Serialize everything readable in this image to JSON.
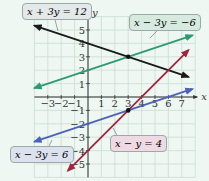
{
  "chart_data": {
    "type": "line",
    "title": "",
    "xlabel": "x",
    "ylabel": "y",
    "xlim": [
      -4,
      8
    ],
    "ylim": [
      -6,
      6
    ],
    "grid": true,
    "x_ticks": [
      "-3",
      "-2",
      "-1",
      "1",
      "2",
      "3",
      "4",
      "5",
      "6",
      "7"
    ],
    "y_ticks": [
      "5",
      "4",
      "3",
      "2",
      "1",
      "-1",
      "-2",
      "-3",
      "-4",
      "-5"
    ],
    "series": [
      {
        "name": "x + 3y = 12",
        "equation": "y = 4 - x/3",
        "color": "#1a1a1a",
        "x": [
          -4,
          7.5
        ],
        "y": [
          5.33,
          1.5
        ]
      },
      {
        "name": "x - 3y = -6",
        "equation": "y = 2 + x/3",
        "color": "#2e9a72",
        "x": [
          -4,
          7.8
        ],
        "y": [
          0.67,
          4.6
        ]
      },
      {
        "name": "x - 3y = 6",
        "equation": "y = -2 + x/3",
        "color": "#4d63b8",
        "x": [
          -4,
          7.8
        ],
        "y": [
          -3.33,
          0.6
        ]
      },
      {
        "name": "x - y = 4",
        "equation": "y = x - 4",
        "color": "#a3243f",
        "x": [
          -1.5,
          7.5
        ],
        "y": [
          -5.5,
          3.5
        ]
      }
    ],
    "points": [
      {
        "x": 3,
        "y": 3,
        "label": "intersection of x + 3y = 12 and x - 3y = -6"
      },
      {
        "x": 3,
        "y": -1,
        "label": "intersection of x - 3y = 6 and x - y = 4"
      }
    ],
    "annotations": [
      {
        "text": "x + 3y = 12",
        "bg": "#e6e9ea"
      },
      {
        "text": "x - 3y = -6",
        "bg": "#d8ebe0"
      },
      {
        "text": "x - 3y = 6",
        "bg": "#dde3f0"
      },
      {
        "text": "x - y = 4",
        "bg": "#f0dbe4"
      }
    ]
  },
  "labels": {
    "l1": "x + 3y = 12",
    "l2": "x − 3y = −6",
    "l3": "x − 3y = 6",
    "l4": "x − y = 4",
    "xaxis": "x",
    "yaxis": "y"
  }
}
